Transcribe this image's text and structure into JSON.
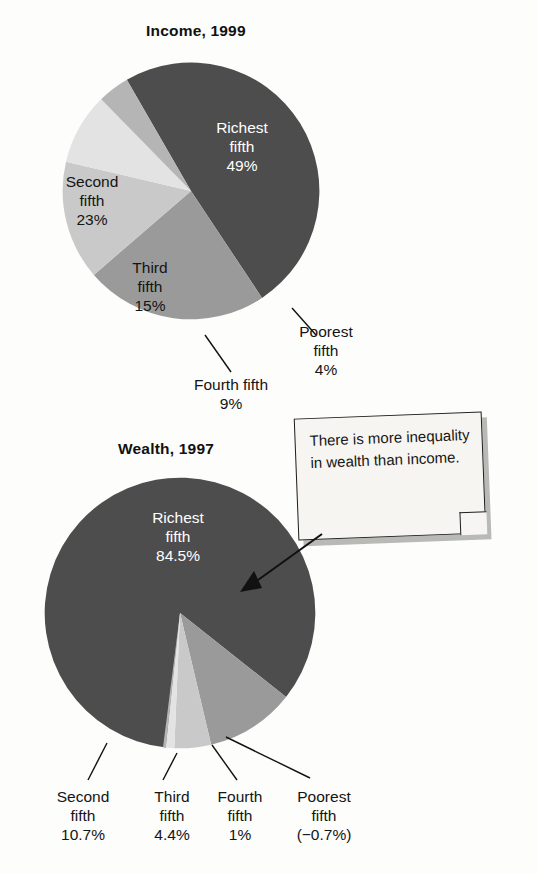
{
  "figure": {
    "callout": {
      "text": "There is more inequality in wealth than income.",
      "arrow_target": "wealth-pie-richest-slice"
    }
  },
  "chart_data": [
    {
      "type": "pie",
      "id": "income-1999",
      "title": "Income, 1999",
      "categories": [
        "Richest fifth",
        "Second fifth",
        "Third fifth",
        "Fourth fifth",
        "Poorest fifth"
      ],
      "values": [
        49,
        23,
        15,
        9,
        4
      ],
      "value_labels": [
        "49%",
        "23%",
        "15%",
        "9%",
        "4%"
      ],
      "unit": "percent",
      "label_placement": [
        "inside",
        "inside",
        "inside",
        "outside",
        "outside"
      ],
      "colors": [
        "#4d4d4d",
        "#9a9a9a",
        "#c9c9c9",
        "#e3e3e3",
        "#b5b5b5"
      ],
      "start_angle_deg": 330,
      "legend": "none"
    },
    {
      "type": "pie",
      "id": "wealth-1997",
      "title": "Wealth, 1997",
      "categories": [
        "Richest fifth",
        "Second fifth",
        "Third fifth",
        "Fourth fifth",
        "Poorest fifth"
      ],
      "values": [
        84.5,
        10.7,
        4.4,
        1,
        -0.7
      ],
      "value_labels": [
        "84.5%",
        "10.7%",
        "4.4%",
        "1%",
        "(−0.7%)"
      ],
      "unit": "percent",
      "label_placement": [
        "inside",
        "outside",
        "outside",
        "outside",
        "outside"
      ],
      "colors": [
        "#4d4d4d",
        "#9a9a9a",
        "#c9c9c9",
        "#e3e3e3",
        "#b5b5b5"
      ],
      "start_angle_deg": 186,
      "legend": "none"
    }
  ],
  "income": {
    "title": "Income, 1999",
    "labels": {
      "richest": {
        "name": "Richest",
        "sub": "fifth",
        "value": "49%"
      },
      "second": {
        "name": "Second",
        "sub": "fifth",
        "value": "23%"
      },
      "third": {
        "name": "Third",
        "sub": "fifth",
        "value": "15%"
      },
      "fourth": {
        "name": "Fourth fifth",
        "sub": "",
        "value": "9%"
      },
      "poorest": {
        "name": "Poorest",
        "sub": "fifth",
        "value": "4%"
      }
    }
  },
  "wealth": {
    "title": "Wealth, 1997",
    "labels": {
      "richest": {
        "name": "Richest",
        "sub": "fifth",
        "value": "84.5%"
      },
      "second": {
        "name": "Second",
        "sub": "fifth",
        "value": "10.7%"
      },
      "third": {
        "name": "Third",
        "sub": "fifth",
        "value": "4.4%"
      },
      "fourth": {
        "name": "Fourth",
        "sub": "fifth",
        "value": "1%"
      },
      "poorest": {
        "name": "Poorest",
        "sub": "fifth",
        "value": "(−0.7%)"
      }
    }
  }
}
